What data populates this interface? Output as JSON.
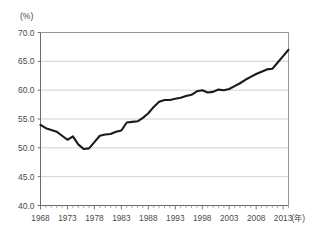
{
  "chart_data": {
    "type": "line",
    "title": "",
    "subtitle": "",
    "xlabel": "(年)",
    "ylabel": "(%)",
    "unit_y": "(%)",
    "unit_x": "(年)",
    "grid": true,
    "legend": "none",
    "ylim": [
      40.0,
      70.0
    ],
    "xlim": [
      1968,
      2014
    ],
    "ytick_labels": [
      "70.0",
      "65.0",
      "60.0",
      "55.0",
      "50.0",
      "45.0",
      "40.0"
    ],
    "ytick_values": [
      70.0,
      65.0,
      60.0,
      55.0,
      50.0,
      45.0,
      40.0
    ],
    "xtick_labels": [
      "1968",
      "1973",
      "1978",
      "1983",
      "1988",
      "1993",
      "1998",
      "2003",
      "2008",
      "2013"
    ],
    "xtick_values": [
      1968,
      1973,
      1978,
      1983,
      1988,
      1993,
      1998,
      2003,
      2008,
      2013
    ],
    "series": [
      {
        "name": "series-1",
        "color": "#1a1a1a",
        "x": [
          1968,
          1969,
          1970,
          1971,
          1972,
          1973,
          1974,
          1975,
          1976,
          1977,
          1978,
          1979,
          1980,
          1981,
          1982,
          1983,
          1984,
          1985,
          1986,
          1987,
          1988,
          1989,
          1990,
          1991,
          1992,
          1993,
          1994,
          1995,
          1996,
          1997,
          1998,
          1999,
          2000,
          2001,
          2002,
          2003,
          2004,
          2005,
          2006,
          2007,
          2008,
          2009,
          2010,
          2011,
          2012,
          2013,
          2014
        ],
        "values": [
          54.0,
          53.4,
          53.1,
          52.8,
          52.1,
          51.4,
          52.0,
          50.6,
          49.8,
          49.9,
          51.0,
          52.1,
          52.3,
          52.4,
          52.8,
          53.0,
          54.4,
          54.5,
          54.6,
          55.2,
          56.0,
          57.1,
          58.0,
          58.3,
          58.3,
          58.5,
          58.7,
          59.0,
          59.2,
          59.8,
          60.0,
          59.6,
          59.7,
          60.1,
          60.0,
          60.2,
          60.7,
          61.2,
          61.8,
          62.3,
          62.8,
          63.2,
          63.6,
          63.7,
          64.8,
          65.9,
          67.0
        ]
      }
    ]
  },
  "axes": {
    "y_unit_label": "(%)",
    "x_unit_label": "(年)"
  }
}
